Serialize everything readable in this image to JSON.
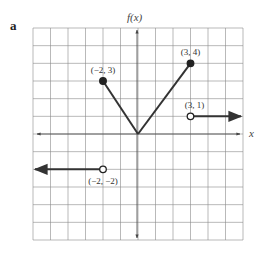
{
  "panel_label": "a",
  "chart_data": {
    "type": "line",
    "title": "",
    "xlabel": "x",
    "ylabel": "f(x)",
    "xlim": [
      -6,
      6
    ],
    "ylim": [
      -6,
      6
    ],
    "grid": true,
    "series": [
      {
        "name": "left ray",
        "points": [
          [
            -6,
            -2
          ],
          [
            -2,
            -2
          ]
        ],
        "left_arrow": true,
        "end": {
          "x": -2,
          "y": -2,
          "style": "open"
        }
      },
      {
        "name": "left segment",
        "points": [
          [
            -2,
            3
          ],
          [
            0,
            0
          ]
        ],
        "start": {
          "x": -2,
          "y": 3,
          "style": "closed"
        }
      },
      {
        "name": "right segment",
        "points": [
          [
            0,
            0
          ],
          [
            3,
            4
          ]
        ],
        "end": {
          "x": 3,
          "y": 4,
          "style": "closed"
        }
      },
      {
        "name": "right ray",
        "points": [
          [
            3,
            1
          ],
          [
            6,
            1
          ]
        ],
        "right_arrow": true,
        "start": {
          "x": 3,
          "y": 1,
          "style": "open"
        }
      }
    ],
    "annotations": [
      {
        "text": "(−2, 3)",
        "x": -2,
        "y": 3
      },
      {
        "text": "(3, 4)",
        "x": 3,
        "y": 4
      },
      {
        "text": "(3, 1)",
        "x": 3,
        "y": 1
      },
      {
        "text": "(−2, −2)",
        "x": -2,
        "y": -2
      }
    ]
  }
}
